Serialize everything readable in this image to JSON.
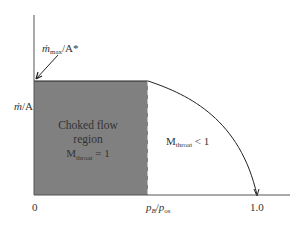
{
  "diagram": {
    "title": "",
    "y_axis": {
      "label_main": "ṁ",
      "label_rest": "/A",
      "top_annotation_main": "ṁ",
      "top_annotation_sub": "max",
      "top_annotation_rest": "/A*"
    },
    "x_axis": {
      "origin_label": "0",
      "critical_label_p": "p",
      "critical_label_sub": "B",
      "critical_label_slash": "/",
      "critical_label_p2": "p",
      "critical_label_sub2": "os",
      "end_label": "1.0"
    },
    "choked_region": {
      "line1": "Choked flow",
      "line2": "region",
      "mach_M": "M",
      "mach_sub": "throat",
      "mach_rest": " = 1",
      "fill_color": "#808080"
    },
    "subsonic_region": {
      "mach_M": "M",
      "mach_sub": "throat",
      "mach_rest": " < 1"
    }
  }
}
